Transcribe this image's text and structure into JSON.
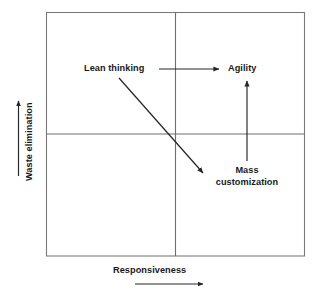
{
  "diagram": {
    "axes": {
      "x": {
        "label": "Responsiveness",
        "arrow_direction": "right"
      },
      "y": {
        "label": "Waste elimination",
        "arrow_direction": "up"
      }
    },
    "nodes": [
      {
        "id": "lean-thinking",
        "label": "Lean thinking",
        "quadrant": "upper-left"
      },
      {
        "id": "agility",
        "label": "Agility",
        "quadrant": "upper-right"
      },
      {
        "id": "mass-customization",
        "label": "Mass customization",
        "line1": "Mass",
        "line2": "customization",
        "quadrant": "lower-right"
      }
    ],
    "connectors": [
      {
        "id": "lean-to-agility",
        "from": "lean-thinking",
        "to": "agility",
        "style": "straight-horizontal"
      },
      {
        "id": "lean-to-mass-customization",
        "from": "lean-thinking",
        "to": "mass-customization",
        "style": "straight-diagonal"
      },
      {
        "id": "mass-customization-to-agility",
        "from": "mass-customization",
        "to": "agility",
        "style": "straight-vertical"
      }
    ],
    "colors": {
      "frame": "#7a7a7a",
      "divider": "#6e6e6e",
      "arrow": "#262626",
      "text": "#1a1a1a",
      "background": "#ffffff"
    }
  }
}
